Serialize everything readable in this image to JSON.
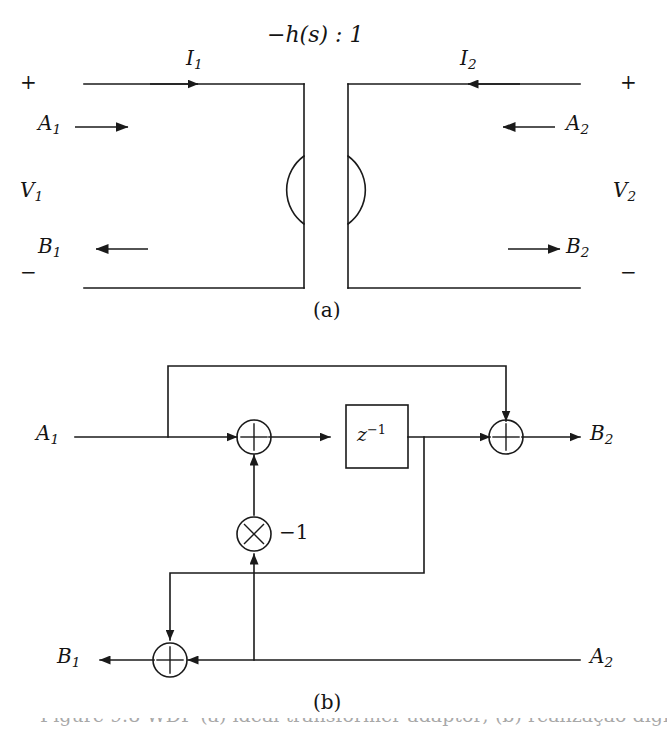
{
  "figure": {
    "panel_a": {
      "transformer_ratio_label": "−h(s) : 1",
      "caption": "(a)",
      "port1": {
        "plus_sign": "+",
        "minus_sign": "−",
        "voltage_label": "V",
        "voltage_sub": "1",
        "current_label": "I",
        "current_sub": "1",
        "incident_wave_label": "A",
        "incident_wave_sub": "1",
        "reflected_wave_label": "B",
        "reflected_wave_sub": "1"
      },
      "port2": {
        "plus_sign": "+",
        "minus_sign": "−",
        "voltage_label": "V",
        "voltage_sub": "2",
        "current_label": "I",
        "current_sub": "2",
        "incident_wave_label": "A",
        "incident_wave_sub": "2",
        "reflected_wave_label": "B",
        "reflected_wave_sub": "2"
      }
    },
    "panel_b": {
      "caption": "(b)",
      "input_left_label": "A",
      "input_left_sub": "1",
      "input_right_label": "A",
      "input_right_sub": "2",
      "output_top_label": "B",
      "output_top_sub": "2",
      "output_bottom_label": "B",
      "output_bottom_sub": "1",
      "delay_block_label": "z",
      "delay_block_exponent": "−1",
      "multiplier_glyph": "×",
      "multiplier_coefficient": "−1",
      "adder_glyph": "+"
    },
    "cut_caption": "Figure 9.8  WDF (a) ideal transformer adaptor; (b) realização digital h(s)"
  },
  "style": {
    "line_color": "#1a1a1a",
    "background": "#ffffff"
  }
}
